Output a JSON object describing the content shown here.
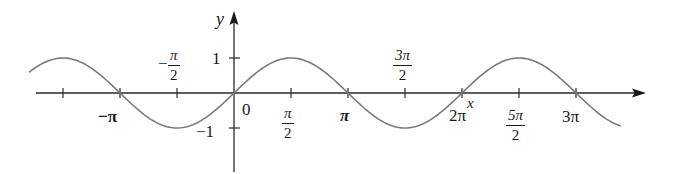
{
  "chart_data": {
    "type": "line",
    "title": "",
    "function": "y = sin x",
    "xlabel": "x",
    "ylabel": "y",
    "xlim": [
      -3.57,
      3.3
    ],
    "ylim": [
      -1.6,
      2.3
    ],
    "grid": false,
    "legend": null,
    "x_ticks": [
      {
        "value": -4.712,
        "label": ""
      },
      {
        "value": -3.1416,
        "label": "−π"
      },
      {
        "value": -1.5708,
        "label": "−π/2"
      },
      {
        "value": 0,
        "label": "0"
      },
      {
        "value": 1.5708,
        "label": "π/2"
      },
      {
        "value": 3.1416,
        "label": "π"
      },
      {
        "value": 4.7124,
        "label": "3π/2"
      },
      {
        "value": 6.2832,
        "label": "2π"
      },
      {
        "value": 7.854,
        "label": "5π/2"
      },
      {
        "value": 9.4248,
        "label": "3π"
      }
    ],
    "y_ticks": [
      {
        "value": 1,
        "label": "1"
      },
      {
        "value": -1,
        "label": "−1"
      }
    ],
    "series": [
      {
        "name": "sin x",
        "color": "#7a7a7a",
        "x": [
          -5.65,
          -4.712,
          -3.1416,
          -1.5708,
          0,
          1.5708,
          3.1416,
          4.7124,
          6.2832,
          7.854,
          9.4248,
          10.66
        ],
        "y": [
          0.59,
          1,
          0,
          -1,
          0,
          1,
          0,
          -1,
          0,
          1,
          0,
          -0.94
        ]
      }
    ]
  },
  "labels": {
    "y_axis": "y",
    "x_axis": "x",
    "origin": "0",
    "y_one": "1",
    "y_neg_one": "−1",
    "neg_pi": "−π",
    "neg_pi_half_sign": "−",
    "neg_pi_half_num": "π",
    "neg_pi_half_den": "2",
    "pi_half_num": "π",
    "pi_half_den": "2",
    "pi": "π",
    "three_pi_half_num": "3π",
    "three_pi_half_den": "2",
    "two_pi": "2π",
    "five_pi_half_num": "5π",
    "five_pi_half_den": "2",
    "three_pi": "3π"
  },
  "colors": {
    "axis": "#2a2a2a",
    "curve": "#7a7a7a",
    "text": "#1a1a1a"
  }
}
